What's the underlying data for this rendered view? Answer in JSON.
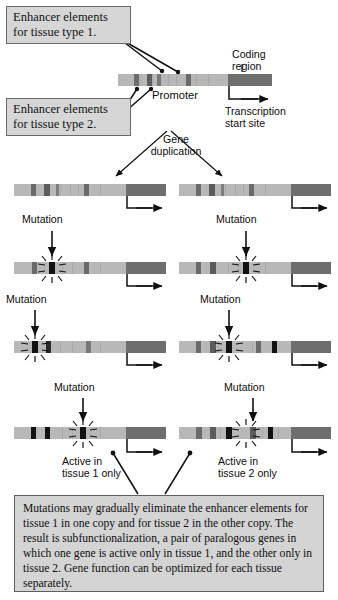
{
  "figure": {
    "background_color": "#ffffff",
    "ink_color": "#111111"
  },
  "palette": {
    "bar_base": "#b0b0b0",
    "bar_base_light": "#bdbdbd",
    "coding_region": "#6e6e6e",
    "enhancer_stripe": "#7a7a7a",
    "enhancer_stripe_dark": "#5c5c5c",
    "mutation_black": "#121212",
    "label_fill": "#d6d6d6",
    "label_border": "#6a6a6a",
    "caption_fill": "#d4d4d4",
    "caption_border": "#5f5f5f"
  },
  "labels": {
    "enhancer_tissue1": "Enhancer elements\nfor tissue type 1.",
    "enhancer_tissue2": "Enhancer elements\nfor tissue type 2.",
    "coding_region": "Coding\nregion",
    "promoter": "Promoter",
    "transcription_start": "Transcription\nstart site",
    "gene_duplication": "Gene\nduplication",
    "mutation": "Mutation",
    "active_tissue1": "Active in\ntissue 1 only",
    "active_tissue2": "Active in\ntissue 2 only"
  },
  "mutation_labels": [
    {
      "id": "mutation-r2-left",
      "text": "Mutation"
    },
    {
      "id": "mutation-r2-right",
      "text": "Mutation"
    },
    {
      "id": "mutation-r3-left",
      "text": "Mutation"
    },
    {
      "id": "mutation-r3-right",
      "text": "Mutation"
    },
    {
      "id": "mutation-r4-left",
      "text": "Mutation"
    },
    {
      "id": "mutation-r4-right",
      "text": "Mutation"
    }
  ],
  "caption": {
    "text": "Mutations may gradually eliminate the enhancer elements for tissue 1 in one copy and for tissue 2 in the other copy. The result is subfunctionalization, a pair of paralogous genes in which one gene is active only in tissue 1, and the other only in tissue 2. Gene function can be optimized for each tissue separately."
  },
  "gene_constructs": [
    {
      "id": "ancestral-gene",
      "row": 0,
      "side": "center",
      "description": "Ancestral single gene copy with four enhancer elements, promoter and coding region.",
      "enhancers": [
        {
          "tissue": 1,
          "state": "intact"
        },
        {
          "tissue": 2,
          "state": "intact"
        },
        {
          "tissue": 1,
          "state": "intact"
        },
        {
          "tissue": 2,
          "state": "intact"
        }
      ],
      "mutated": false,
      "has_coding_region": true
    },
    {
      "id": "duplicate-copy-1-row1",
      "row": 1,
      "side": "left",
      "description": "Gene copy 1 immediately after duplication, all enhancers intact.",
      "enhancers": [
        {
          "tissue": 1,
          "state": "intact"
        },
        {
          "tissue": 2,
          "state": "intact"
        },
        {
          "tissue": 1,
          "state": "intact"
        },
        {
          "tissue": 2,
          "state": "intact"
        }
      ],
      "mutated": false,
      "has_coding_region": true
    },
    {
      "id": "duplicate-copy-2-row1",
      "row": 1,
      "side": "right",
      "description": "Gene copy 2 immediately after duplication, all enhancers intact.",
      "enhancers": [
        {
          "tissue": 1,
          "state": "intact"
        },
        {
          "tissue": 2,
          "state": "intact"
        },
        {
          "tissue": 1,
          "state": "intact"
        },
        {
          "tissue": 2,
          "state": "intact"
        }
      ],
      "mutated": false,
      "has_coding_region": true
    },
    {
      "id": "duplicate-copy-1-row2",
      "row": 2,
      "side": "left",
      "description": "Gene copy 1 after first mutation knocking out a tissue 2 enhancer.",
      "enhancers": [
        {
          "tissue": 1,
          "state": "intact"
        },
        {
          "tissue": 2,
          "state": "mutated"
        },
        {
          "tissue": 1,
          "state": "intact"
        },
        {
          "tissue": 2,
          "state": "intact"
        }
      ],
      "mutated": true,
      "has_coding_region": true
    },
    {
      "id": "duplicate-copy-2-row2",
      "row": 2,
      "side": "right",
      "description": "Gene copy 2 after first mutation knocking out a tissue 1 enhancer.",
      "enhancers": [
        {
          "tissue": 1,
          "state": "intact"
        },
        {
          "tissue": 2,
          "state": "intact"
        },
        {
          "tissue": 1,
          "state": "mutated"
        },
        {
          "tissue": 2,
          "state": "intact"
        }
      ],
      "mutated": true,
      "has_coding_region": true
    },
    {
      "id": "duplicate-copy-1-row3",
      "row": 3,
      "side": "left",
      "description": "Gene copy 1 after second mutation; both tissue 2 enhancers knocked out.",
      "enhancers": [
        {
          "tissue": 2,
          "state": "mutated"
        },
        {
          "tissue": 1,
          "state": "intact"
        },
        {
          "tissue": 1,
          "state": "intact"
        },
        {
          "tissue": 2,
          "state": "intact"
        }
      ],
      "mutated": true,
      "has_coding_region": true
    },
    {
      "id": "duplicate-copy-2-row3",
      "row": 3,
      "side": "right",
      "description": "Gene copy 2 after second mutation; tissue 1 enhancers progressively knocked out.",
      "enhancers": [
        {
          "tissue": 1,
          "state": "intact"
        },
        {
          "tissue": 2,
          "state": "intact"
        },
        {
          "tissue": 1,
          "state": "mutated"
        },
        {
          "tissue": 1,
          "state": "mutated"
        }
      ],
      "mutated": true,
      "has_coding_region": true
    },
    {
      "id": "paralog-active-tissue1",
      "row": 4,
      "side": "left",
      "description": "Final paralog active in tissue 1 only; all tissue 2 enhancers eliminated.",
      "enhancers": [
        {
          "tissue": 2,
          "state": "mutated"
        },
        {
          "tissue": 2,
          "state": "mutated"
        },
        {
          "tissue": 2,
          "state": "mutated"
        },
        {
          "tissue": 1,
          "state": "intact"
        }
      ],
      "mutated": true,
      "has_coding_region": true
    },
    {
      "id": "paralog-active-tissue2",
      "row": 4,
      "side": "right",
      "description": "Final paralog active in tissue 2 only; all tissue 1 enhancers eliminated.",
      "enhancers": [
        {
          "tissue": 1,
          "state": "mutated"
        },
        {
          "tissue": 1,
          "state": "mutated"
        },
        {
          "tissue": 1,
          "state": "mutated"
        },
        {
          "tissue": 2,
          "state": "intact"
        }
      ],
      "mutated": true,
      "has_coding_region": true
    }
  ]
}
